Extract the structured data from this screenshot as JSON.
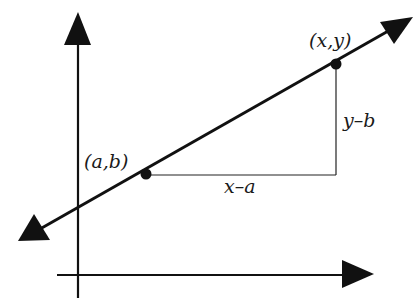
{
  "diagram": {
    "type": "coordinate-slope-diagram",
    "labels": {
      "point_xy": "(x,y)",
      "point_ab": "(a,b)",
      "rise": "y–b",
      "run": "x–a"
    },
    "colors": {
      "ink": "#111111",
      "background": "#ffffff"
    }
  }
}
